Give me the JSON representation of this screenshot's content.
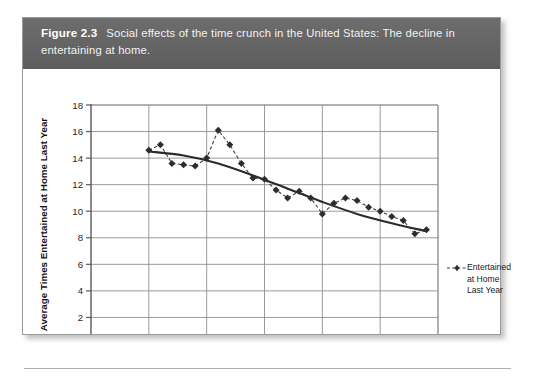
{
  "figure": {
    "label": "Figure 2.3",
    "caption": "Social effects of the time crunch in the United States: The decline in entertaining at home.",
    "caption_bar_color": "#636363",
    "card_background": "#ffffff"
  },
  "legend": {
    "position": "right",
    "entries": [
      {
        "name": "Entertained at Home Last Year",
        "line_style": "dashed",
        "marker": "diamond",
        "color": "#3a3a3a"
      }
    ],
    "line1": "Entertained",
    "line2": "at Home",
    "line3": "Last Year"
  },
  "chart_data": {
    "type": "line",
    "title": "",
    "subtitle": "",
    "xlabel": "",
    "ylabel": "Average Times Entertained at Home Last Year",
    "xlim": [
      1970,
      2000
    ],
    "ylim": [
      0,
      18
    ],
    "xticks": [
      1970,
      1975,
      1980,
      1985,
      1990,
      1995,
      2000
    ],
    "yticks": [
      0,
      2,
      4,
      6,
      8,
      10,
      12,
      14,
      16,
      18
    ],
    "grid": true,
    "grid_color": "#8e8e8e",
    "axis_color": "#5a5a5a",
    "legend_position": "right",
    "series": [
      {
        "name": "Entertained at Home Last Year",
        "line_style": "dashed",
        "marker": "diamond",
        "color": "#3a3a3a",
        "x": [
          1975,
          1976,
          1977,
          1978,
          1979,
          1980,
          1981,
          1982,
          1983,
          1984,
          1985,
          1986,
          1987,
          1988,
          1989,
          1990,
          1991,
          1992,
          1993,
          1994,
          1995,
          1996,
          1997,
          1998,
          1999
        ],
        "values": [
          14.6,
          15.0,
          13.6,
          13.5,
          13.4,
          14.0,
          16.1,
          15.0,
          13.6,
          12.5,
          12.4,
          11.6,
          11.0,
          11.5,
          11.0,
          9.8,
          10.6,
          11.0,
          10.8,
          10.3,
          10.0,
          9.6,
          9.3,
          8.3,
          8.6
        ]
      },
      {
        "name": "Trend",
        "line_style": "solid",
        "marker": "none",
        "color": "#2b2b2b",
        "x": [
          1975,
          1978,
          1981,
          1984,
          1987,
          1990,
          1993,
          1996,
          1999
        ],
        "values": [
          14.5,
          14.2,
          13.6,
          12.7,
          11.7,
          10.7,
          9.8,
          9.1,
          8.5
        ]
      }
    ]
  }
}
